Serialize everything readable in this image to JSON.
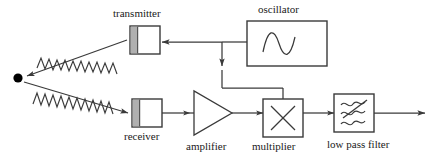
{
  "diagram": {
    "type": "block-diagram",
    "stroke_color": "#3a3a3a",
    "label_color": "#1a1a1a",
    "background_color": "#ffffff",
    "block_fill": "#ffffff",
    "aperture_fill": "#b0b0b0",
    "target_color": "#000000",
    "labels": {
      "transmitter": "transmitter",
      "oscillator": "oscillator",
      "receiver": "receiver",
      "amplifier": "amplifier",
      "multiplier": "multiplier",
      "low_pass_filter": "low pass filter"
    },
    "blocks": [
      {
        "name": "transmitter",
        "label": "transmitter",
        "shape": "box-with-aperture",
        "label_position": "top"
      },
      {
        "name": "oscillator",
        "label": "oscillator",
        "shape": "box",
        "glyph": "sine-wave",
        "label_position": "top"
      },
      {
        "name": "receiver",
        "label": "receiver",
        "shape": "box-with-aperture",
        "label_position": "bottom"
      },
      {
        "name": "amplifier",
        "label": "amplifier",
        "shape": "triangle",
        "label_position": "bottom"
      },
      {
        "name": "multiplier",
        "label": "multiplier",
        "shape": "box",
        "glyph": "cross-x",
        "label_position": "bottom"
      },
      {
        "name": "low-pass-filter",
        "label": "low pass filter",
        "shape": "box",
        "glyph": "wavy-lines-slash",
        "label_position": "bottom"
      }
    ],
    "nodes": [
      {
        "name": "target",
        "shape": "dot"
      }
    ],
    "signals": [
      {
        "name": "transmitted-wave",
        "from": "transmitter",
        "to": "target",
        "style": "zigzag-arrow"
      },
      {
        "name": "reflected-wave",
        "from": "target",
        "to": "receiver",
        "style": "zigzag-arrow"
      }
    ],
    "connections": [
      {
        "name": "oscillator-to-transmitter",
        "from": "oscillator",
        "to": "transmitter",
        "direction": "left"
      },
      {
        "name": "oscillator-to-multiplier",
        "from": "oscillator",
        "to": "multiplier",
        "direction": "down"
      },
      {
        "name": "receiver-to-amplifier",
        "from": "receiver",
        "to": "amplifier",
        "direction": "right"
      },
      {
        "name": "amplifier-to-multiplier",
        "from": "amplifier",
        "to": "multiplier",
        "direction": "right"
      },
      {
        "name": "multiplier-to-filter",
        "from": "multiplier",
        "to": "low-pass-filter",
        "direction": "right"
      },
      {
        "name": "filter-output",
        "from": "low-pass-filter",
        "to": "output",
        "direction": "right"
      }
    ]
  }
}
